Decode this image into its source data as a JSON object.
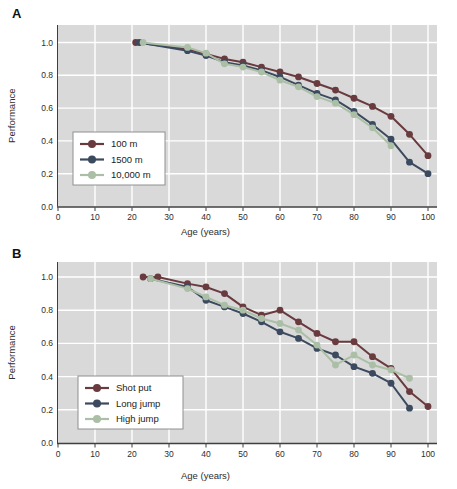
{
  "figure_title": "Performance decline with age in athletic events",
  "colors": {
    "plot_background": "#d9d9d9",
    "gridline": "#ffffff",
    "axis": "#3f3f3f",
    "text": "#2e2e2e",
    "legend_border": "#909090",
    "legend_background": "#ffffff",
    "series_red": "#693a3e",
    "series_blue": "#3c4a5f",
    "series_green": "#abbfa6"
  },
  "chart_data": [
    {
      "panel_label": "A",
      "type": "line",
      "title": "",
      "xlabel": "Age (years)",
      "ylabel": "Performance",
      "xlim": [
        0,
        102.5
      ],
      "ylim": [
        0,
        1.11
      ],
      "xticks": [
        0,
        10,
        20,
        30,
        40,
        50,
        60,
        70,
        80,
        90,
        100
      ],
      "ytick_labels": [
        "0.0",
        "0.2",
        "0.4",
        "0.6",
        "0.8",
        "1.0"
      ],
      "ytick_values": [
        0.0,
        0.2,
        0.4,
        0.6,
        0.8,
        1.0
      ],
      "grid": true,
      "legend_position": "lower-left",
      "series": [
        {
          "name": "100 m",
          "color": "#693a3e",
          "x": [
            21,
            35,
            40,
            45,
            50,
            55,
            60,
            65,
            70,
            75,
            80,
            85,
            90,
            95,
            100
          ],
          "y": [
            1.0,
            0.96,
            0.93,
            0.9,
            0.88,
            0.85,
            0.82,
            0.79,
            0.75,
            0.71,
            0.66,
            0.61,
            0.55,
            0.44,
            0.31
          ]
        },
        {
          "name": "1500 m",
          "color": "#3c4a5f",
          "x": [
            22,
            35,
            40,
            45,
            50,
            55,
            60,
            65,
            70,
            75,
            80,
            85,
            90,
            95,
            100
          ],
          "y": [
            1.0,
            0.95,
            0.92,
            0.88,
            0.86,
            0.83,
            0.79,
            0.74,
            0.69,
            0.65,
            0.58,
            0.5,
            0.41,
            0.27,
            0.2
          ]
        },
        {
          "name": "10,000 m",
          "color": "#abbfa6",
          "x": [
            23,
            35,
            40,
            45,
            50,
            55,
            60,
            65,
            70,
            75,
            80,
            85,
            90
          ],
          "y": [
            1.0,
            0.97,
            0.935,
            0.87,
            0.85,
            0.82,
            0.77,
            0.73,
            0.67,
            0.63,
            0.56,
            0.48,
            0.37
          ]
        }
      ]
    },
    {
      "panel_label": "B",
      "type": "line",
      "title": "",
      "xlabel": "Age (years)",
      "ylabel": "Performance",
      "xlim": [
        0,
        102.5
      ],
      "ylim": [
        0,
        1.11
      ],
      "xticks": [
        0,
        10,
        20,
        30,
        40,
        50,
        60,
        70,
        80,
        90,
        100
      ],
      "ytick_labels": [
        "0.0",
        "0.2",
        "0.4",
        "0.6",
        "0.8",
        "1.0"
      ],
      "ytick_values": [
        0.0,
        0.2,
        0.4,
        0.6,
        0.8,
        1.0
      ],
      "grid": true,
      "legend_position": "lower-left",
      "series": [
        {
          "name": "Shot put",
          "color": "#693a3e",
          "x": [
            23,
            27,
            35,
            40,
            45,
            50,
            55,
            60,
            65,
            70,
            75,
            80,
            85,
            90,
            95,
            100
          ],
          "y": [
            1.0,
            1.0,
            0.96,
            0.94,
            0.9,
            0.82,
            0.77,
            0.8,
            0.73,
            0.66,
            0.61,
            0.61,
            0.52,
            0.45,
            0.31,
            0.22
          ]
        },
        {
          "name": "Long jump",
          "color": "#3c4a5f",
          "x": [
            25,
            35,
            40,
            45,
            50,
            55,
            60,
            65,
            70,
            75,
            80,
            85,
            90,
            95
          ],
          "y": [
            0.99,
            0.94,
            0.86,
            0.82,
            0.78,
            0.73,
            0.67,
            0.63,
            0.57,
            0.53,
            0.46,
            0.42,
            0.36,
            0.21
          ]
        },
        {
          "name": "High jump",
          "color": "#abbfa6",
          "x": [
            25,
            35,
            40,
            45,
            50,
            55,
            60,
            65,
            70,
            75,
            80,
            85,
            90,
            95
          ],
          "y": [
            0.99,
            0.93,
            0.88,
            0.83,
            0.8,
            0.75,
            0.72,
            0.68,
            0.59,
            0.47,
            0.53,
            0.47,
            0.44,
            0.39
          ]
        }
      ]
    }
  ]
}
